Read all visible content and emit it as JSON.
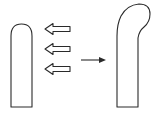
{
  "diagram": {
    "title": "",
    "elements": [
      {
        "id": "original-rod",
        "label": "",
        "shape": "straight-rounded-rod"
      },
      {
        "id": "force-arrows",
        "label": "",
        "count": 3,
        "direction": "left",
        "style": "hollow"
      },
      {
        "id": "transform-arrow",
        "label": "",
        "direction": "right",
        "style": "solid"
      },
      {
        "id": "bent-rod",
        "label": "",
        "shape": "rod-bent-at-tip"
      }
    ],
    "colors": {
      "stroke": "#2a2a2a",
      "background": "#ffffff"
    }
  }
}
